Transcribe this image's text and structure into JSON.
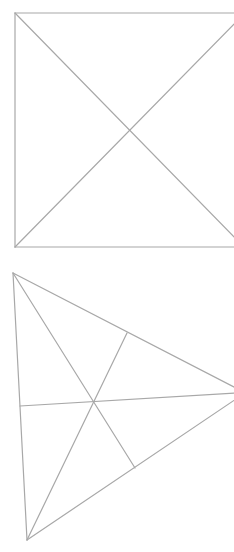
{
  "canvas": {
    "width": 234,
    "height": 552,
    "background": "#ffffff"
  },
  "style": {
    "stroke_color": "#a8a8a8"
  },
  "figures": {
    "square": {
      "label": "",
      "corners": {
        "top_left": [
          15,
          13
        ],
        "top_right": [
          234,
          13
        ],
        "bottom_right": [
          234,
          247
        ],
        "bottom_left": [
          15,
          247
        ]
      },
      "diagonals": [
        {
          "from": [
            15,
            13
          ],
          "to": [
            234,
            237
          ]
        },
        {
          "from": [
            15,
            247
          ],
          "to": [
            234,
            24
          ]
        }
      ],
      "intersection": [
        128,
        129
      ]
    },
    "triangle": {
      "label": "",
      "vertices": {
        "top": [
          13,
          273
        ],
        "right": [
          236,
          388
        ],
        "bottom": [
          27,
          540
        ]
      },
      "centroid": [
        95,
        403
      ],
      "edge_midpoints": {
        "upper": [
          127,
          333
        ],
        "lower": [
          135,
          468
        ],
        "left": [
          20,
          406
        ]
      },
      "medians": [
        {
          "from": [
            13,
            273
          ],
          "to": [
            135,
            468
          ]
        },
        {
          "from": [
            27,
            540
          ],
          "to": [
            127,
            333
          ]
        },
        {
          "from": [
            20,
            406
          ],
          "to": [
            236,
            393
          ]
        }
      ]
    }
  }
}
